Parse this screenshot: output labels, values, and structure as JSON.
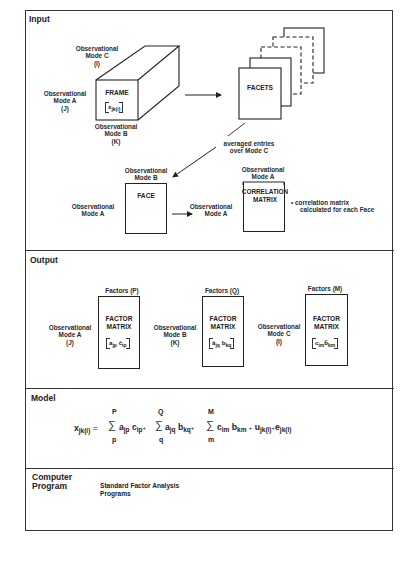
{
  "sections": {
    "input": {
      "title": "Input",
      "frame": {
        "label": "FRAME",
        "matrix": "x",
        "matrix_sub": "jk(i)",
        "mode_c": [
          "Observational",
          "Mode C",
          "(I)"
        ],
        "mode_a": [
          "Observational",
          "Mode A",
          "(J)"
        ],
        "mode_b": [
          "Observational",
          "Mode B",
          "(K)"
        ]
      },
      "facets": {
        "label": "FACETS"
      },
      "averaged_note": [
        "averaged entries",
        "over Mode C"
      ],
      "face": {
        "label": "FACE",
        "mode_b": [
          "Observational",
          "Mode B"
        ],
        "mode_a": [
          "Observational",
          "Mode A"
        ]
      },
      "arrow_label": [
        "Observational",
        "Mode A"
      ],
      "correlation": {
        "label": [
          "CORRELATION",
          "MATRIX"
        ],
        "mode_a": [
          "Observational",
          "Mode A"
        ],
        "note": [
          "•  correlation matrix",
          "calculated for each Face"
        ]
      }
    },
    "output": {
      "title": "Output",
      "matrices": [
        {
          "factors": "Factors (P)",
          "mode": [
            "Observational",
            "Mode A",
            "(J)"
          ],
          "label": [
            "FACTOR",
            "MATRIX"
          ],
          "entry": [
            "a",
            "jp",
            " ĉ",
            "ip"
          ]
        },
        {
          "factors": "Factors (Q)",
          "mode": [
            "Observational",
            "Mode B",
            "(K)"
          ],
          "label": [
            "FACTOR",
            "MATRIX"
          ],
          "entry": [
            "â",
            "jq",
            " b",
            "kq"
          ]
        },
        {
          "factors": "Factors (M)",
          "mode": [
            "Observational",
            "Mode C",
            "(I)"
          ],
          "label": [
            "FACTOR",
            "MATRIX"
          ],
          "entry": [
            "c",
            "im",
            "b̂",
            "km"
          ]
        }
      ]
    },
    "model": {
      "title": "Model",
      "equation": {
        "lhs": "x",
        "lhs_sub": "jk(i)",
        "eq": "=",
        "sum1": {
          "upper": "P",
          "lower": "p"
        },
        "t1": [
          "a",
          "jp",
          "c",
          "ip"
        ],
        "sum2": {
          "upper": "Q",
          "lower": "q"
        },
        "t2": [
          "a",
          "jq",
          "b",
          "kq"
        ],
        "sum3": {
          "upper": "M",
          "lower": "m"
        },
        "t3": [
          "c",
          "im",
          "b",
          "km"
        ],
        "plus": "+",
        "u": "u",
        "u_sub": "jk(i)",
        "e": "e",
        "e_sub": "jk(i)",
        "sigma": "∑"
      }
    },
    "computer_program": {
      "title": [
        "Computer",
        "Program"
      ],
      "text": [
        "Standard Factor Analysis",
        "Programs"
      ]
    }
  },
  "colors": {
    "line": "#222222",
    "background": "#ffffff"
  }
}
